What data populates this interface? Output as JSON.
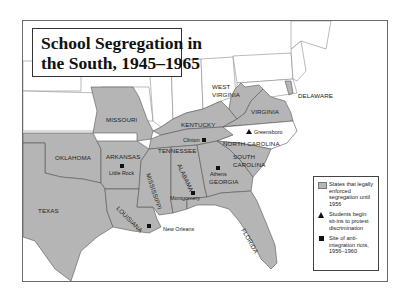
{
  "title": {
    "line1": "School Segregation in",
    "line2": "the South, 1945–1965"
  },
  "colors": {
    "segregated_fill": "#b5b5b5",
    "background": "#ffffff",
    "border": "#555555",
    "marker": "#111111"
  },
  "states": {
    "segregated": [
      "MISSOURI",
      "KENTUCKY",
      "WEST VIRGINIA",
      "VIRGINIA",
      "DELAWARE",
      "NORTH CAROLINA",
      "TENNESSEE",
      "OKLAHOMA",
      "ARKANSAS",
      "SOUTH CAROLINA",
      "TEXAS",
      "LOUISIANA",
      "MISSISSIPPI",
      "ALABAMA",
      "GEORGIA",
      "FLORIDA"
    ],
    "labels": {
      "missouri": "MISSOURI",
      "kentucky": "KENTUCKY",
      "west_virginia_1": "WEST",
      "west_virginia_2": "VIRGINIA",
      "virginia": "VIRGINIA",
      "delaware": "DELAWARE",
      "north_carolina": "NORTH CAROLINA",
      "tennessee": "TENNESSEE",
      "oklahoma": "OKLAHOMA",
      "arkansas": "ARKANSAS",
      "south_carolina_1": "SOUTH",
      "south_carolina_2": "CAROLINA",
      "texas": "TEXAS",
      "louisiana": "LOUISIANA",
      "mississippi": "MISSISSIPPI",
      "alabama": "ALABAMA",
      "georgia": "GEORGIA",
      "florida": "FLORIDA"
    }
  },
  "cities": {
    "greensboro": {
      "name": "Greensboro",
      "marker": "triangle"
    },
    "clinton": {
      "name": "Clinton",
      "marker": "square"
    },
    "little_rock": {
      "name": "Little Rock",
      "marker": "square"
    },
    "athens": {
      "name": "Athens",
      "marker": "square"
    },
    "montgomery": {
      "name": "Montgomery",
      "marker": "square"
    },
    "new_orleans": {
      "name": "New Orleans",
      "marker": "square"
    }
  },
  "legend": {
    "items": [
      {
        "symbol": "gray-swatch",
        "text": "States that legally enforced segregation until 1956"
      },
      {
        "symbol": "triangle",
        "text": "Students begin sit-ins to protest discrimination"
      },
      {
        "symbol": "square",
        "text": "Site of anti-integration riots, 1956–1960"
      }
    ]
  }
}
